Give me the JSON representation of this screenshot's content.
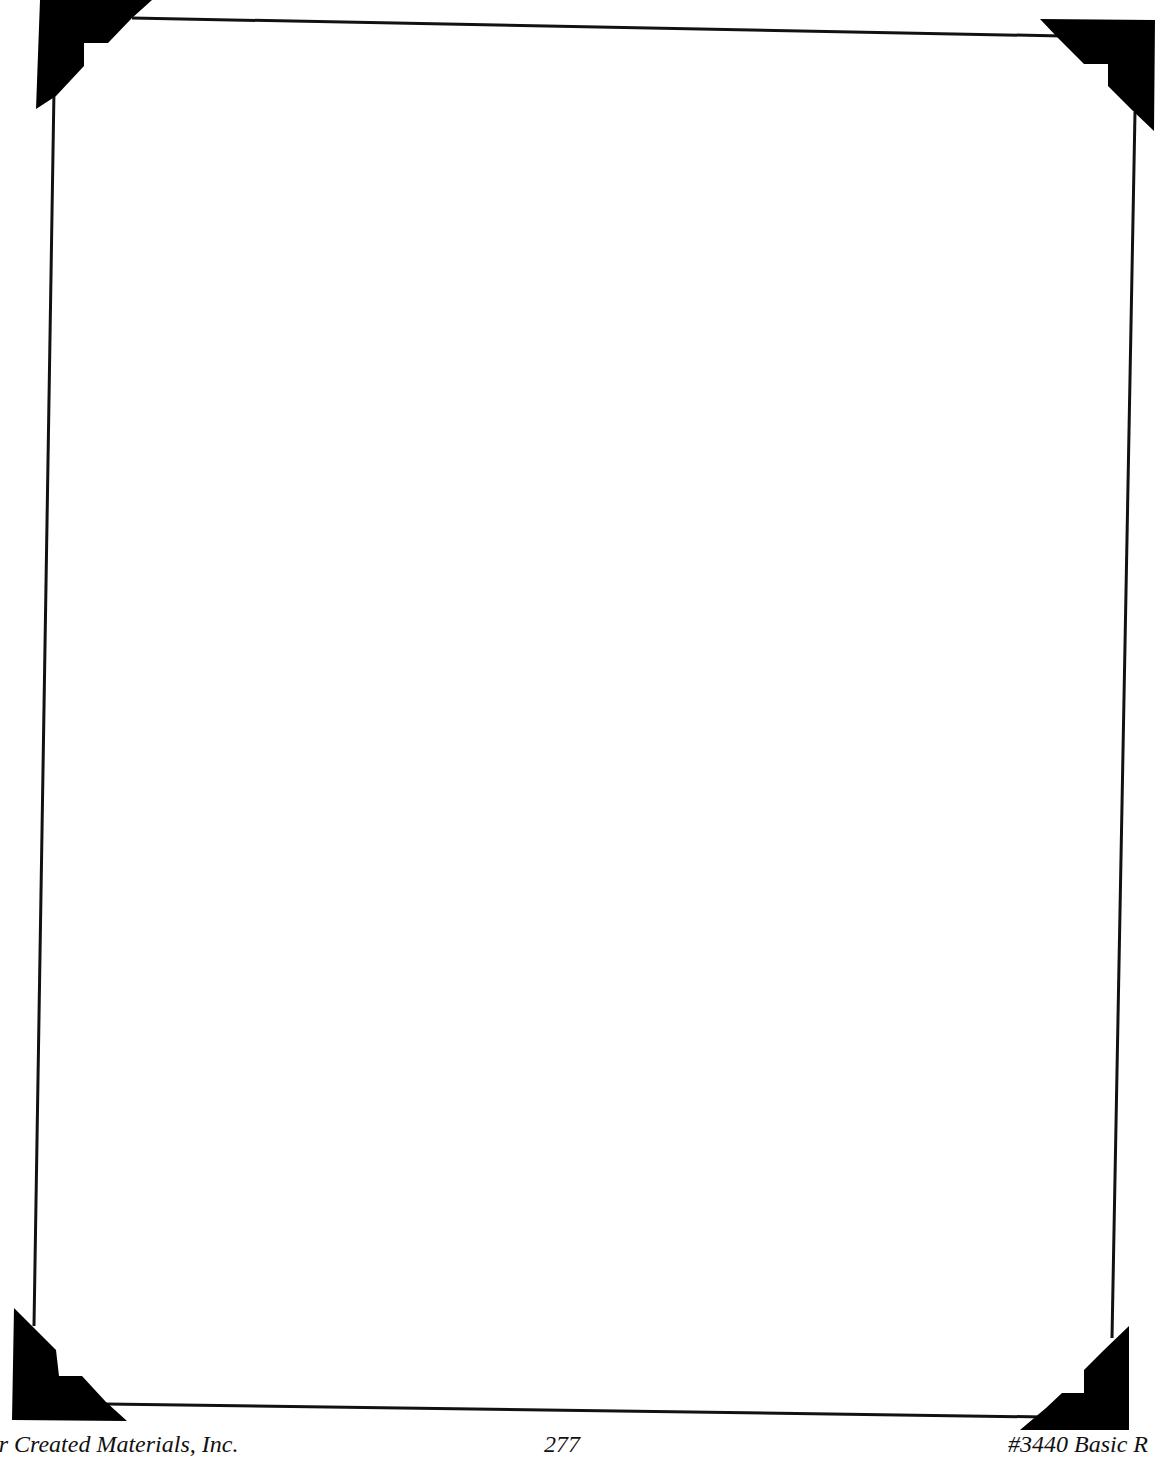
{
  "page": {
    "type": "blank bordered page",
    "border_color": "#000000",
    "background": "#ffffff"
  },
  "frame": {
    "corners": [
      "top-left",
      "top-right",
      "bottom-left",
      "bottom-right"
    ],
    "ornament": "stepped-triangle-corner"
  },
  "footer": {
    "publisher": "er Created Materials, Inc.",
    "page_number": "277",
    "product_code": "#3440 Basic R"
  }
}
